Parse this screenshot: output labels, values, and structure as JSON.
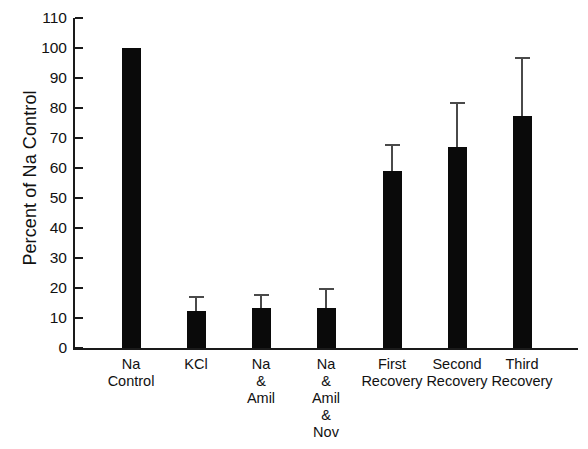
{
  "chart_data": {
    "type": "bar",
    "title": "",
    "xlabel": "",
    "ylabel": "Percent of Na Control",
    "ylim": [
      0,
      110
    ],
    "ytick_step": 10,
    "yticks": [
      110,
      100,
      90,
      80,
      70,
      60,
      50,
      40,
      30,
      20,
      10,
      0
    ],
    "grid": false,
    "legend": null,
    "bar_color": "#0a0a0a",
    "errorbar_color": "#4a4a4a",
    "categories": [
      "Na\nControl",
      "KCl",
      "Na\n&\nAmil",
      "Na\n&\nAmil\n&\nNov",
      "First\nRecovery",
      "Second\nRecovery",
      "Third\nRecovery"
    ],
    "category_lines": [
      [
        "Na",
        "Control"
      ],
      [
        "KCl"
      ],
      [
        "Na",
        "&",
        "Amil"
      ],
      [
        "Na",
        "&",
        "Amil",
        "&",
        "Nov"
      ],
      [
        "First",
        "Recovery"
      ],
      [
        "Second",
        "Recovery"
      ],
      [
        "Third",
        "Recovery"
      ]
    ],
    "values": [
      100,
      12.5,
      13.5,
      13.5,
      59,
      67,
      77.5
    ],
    "errors_upper": [
      null,
      17.5,
      18,
      20,
      68,
      82,
      97
    ],
    "series": [
      {
        "name": "Percent of Na Control",
        "values": [
          100,
          12.5,
          13.5,
          13.5,
          59,
          67,
          77.5
        ],
        "errors_upper": [
          null,
          17.5,
          18,
          20,
          68,
          82,
          97
        ]
      }
    ]
  }
}
